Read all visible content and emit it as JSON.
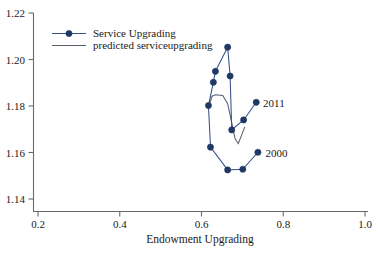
{
  "chart_data": {
    "type": "scatter",
    "title": "",
    "subtitle": "",
    "xlabel": "Endowment Upgrading",
    "ylabel": "",
    "xlim": [
      0.2,
      1.0
    ],
    "ylim": [
      1.14,
      1.22
    ],
    "xticks": [
      "0.2",
      "0.4",
      "0.6",
      "0.8",
      "1.0"
    ],
    "xtick_values": [
      0.2,
      0.4,
      0.6,
      0.8,
      1.0
    ],
    "yticks": [
      "1.14",
      "1.16",
      "1.18",
      "1.20",
      "1.22"
    ],
    "ytick_values": [
      1.14,
      1.16,
      1.18,
      1.2,
      1.22
    ],
    "grid": false,
    "legend_position": "top-left",
    "annotations": [
      {
        "text": "2011",
        "x": 0.736,
        "y": 1.1815
      },
      {
        "text": "2000",
        "x": 0.742,
        "y": 1.16
      }
    ],
    "series": [
      {
        "name": "Service Upgrading",
        "style": "line-with-markers",
        "color": "#203864",
        "marker": "filled-circle",
        "points": [
          {
            "label": "2000",
            "x": 0.738,
            "y": 1.1601
          },
          {
            "label": "2001",
            "x": 0.701,
            "y": 1.1528
          },
          {
            "label": "2002",
            "x": 0.664,
            "y": 1.1525
          },
          {
            "label": "2003",
            "x": 0.622,
            "y": 1.1623
          },
          {
            "label": "2004",
            "x": 0.617,
            "y": 1.1802
          },
          {
            "label": "2005",
            "x": 0.629,
            "y": 1.1902
          },
          {
            "label": "2006",
            "x": 0.634,
            "y": 1.1949
          },
          {
            "label": "2007",
            "x": 0.664,
            "y": 1.2053
          },
          {
            "label": "2008",
            "x": 0.67,
            "y": 1.1929
          },
          {
            "label": "2009",
            "x": 0.674,
            "y": 1.1697
          },
          {
            "label": "2010",
            "x": 0.703,
            "y": 1.174
          },
          {
            "label": "2011",
            "x": 0.734,
            "y": 1.1816
          }
        ]
      },
      {
        "name": "predicted serviceupgrading",
        "style": "line",
        "color": "#555f6b",
        "marker": "none",
        "points": [
          {
            "x": 0.618,
            "y": 1.18
          },
          {
            "x": 0.626,
            "y": 1.1842
          },
          {
            "x": 0.634,
            "y": 1.1848
          },
          {
            "x": 0.652,
            "y": 1.1845
          },
          {
            "x": 0.664,
            "y": 1.181
          },
          {
            "x": 0.672,
            "y": 1.1745
          },
          {
            "x": 0.682,
            "y": 1.166
          },
          {
            "x": 0.69,
            "y": 1.1638
          },
          {
            "x": 0.706,
            "y": 1.171
          }
        ]
      }
    ]
  },
  "legend": {
    "entries": [
      {
        "label": "Service Upgrading",
        "marker": "filled-circle-with-line"
      },
      {
        "label": "predicted serviceupgrading",
        "marker": "plain-line"
      }
    ]
  },
  "axes": {
    "x_title": "Endowment Upgrading",
    "x_tick_labels": [
      "0.2",
      "0.4",
      "0.6",
      "0.8",
      "1.0"
    ],
    "y_tick_labels": [
      "1.14",
      "1.16",
      "1.18",
      "1.20",
      "1.22"
    ]
  },
  "colors": {
    "series": "#203864",
    "predicted": "#555f6b",
    "axis": "#6b6b6b",
    "text": "#1a1a1a",
    "background": "#ffffff"
  }
}
